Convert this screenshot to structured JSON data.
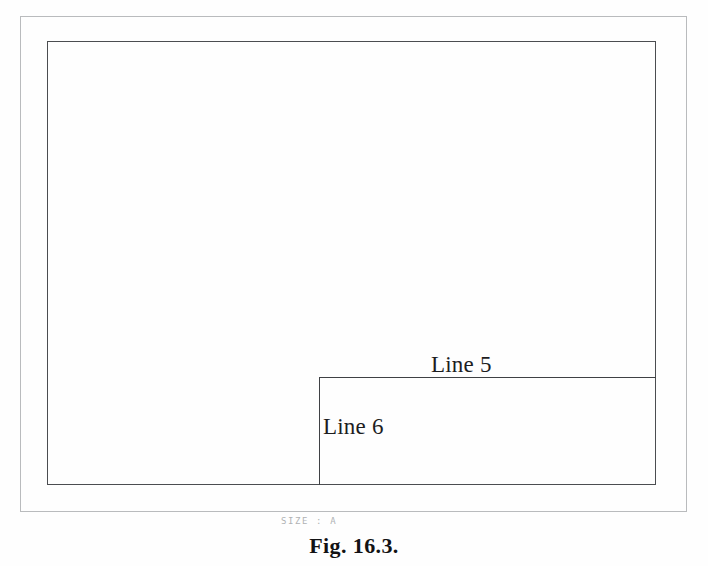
{
  "figure": {
    "caption": "Fig. 16.3.",
    "sheet_size_note": "SIZE : A",
    "background_color": "#fefefe",
    "sheet_frame": {
      "name": "outer sheet border",
      "color": "#b9bbbd",
      "x": 20,
      "y": 16,
      "width": 667,
      "height": 496
    },
    "drawing_frame": {
      "name": "inner drawing border",
      "color": "#4b4d50",
      "x": 47,
      "y": 41,
      "width": 609,
      "height": 444
    },
    "title_block": {
      "name": "title block rectangle",
      "color": "#3f4144",
      "x": 319,
      "y": 377,
      "width": 337,
      "height": 108,
      "open_edges": [
        "right",
        "bottom"
      ]
    },
    "labels": [
      {
        "id": "line5",
        "text": "Line 5",
        "refers_to": "title block top horizontal edge",
        "x": 431,
        "y": 353
      },
      {
        "id": "line6",
        "text": "Line 6",
        "refers_to": "title block left vertical edge",
        "x": 323,
        "y": 415
      }
    ]
  }
}
